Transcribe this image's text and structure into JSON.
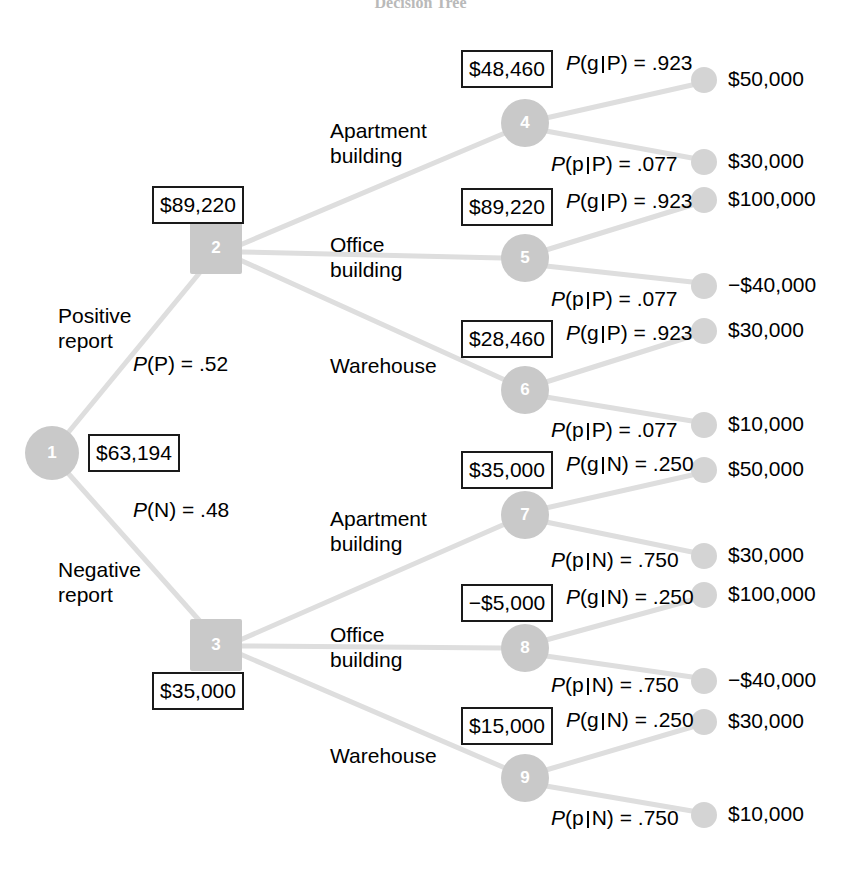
{
  "figure": {
    "title": "Decision Tree",
    "type": "decision-tree"
  },
  "nodes": [
    {
      "id": "1",
      "label": "1",
      "kind": "chance",
      "x": 52,
      "y": 453,
      "r": 27,
      "ev": "$63,194"
    },
    {
      "id": "2",
      "label": "2",
      "kind": "decision",
      "x": 216,
      "y": 248,
      "r": 26,
      "ev": "$89,220"
    },
    {
      "id": "3",
      "label": "3",
      "kind": "decision",
      "x": 216,
      "y": 645,
      "r": 26,
      "ev": "$35,000"
    },
    {
      "id": "4",
      "label": "4",
      "kind": "chance",
      "x": 525,
      "y": 123,
      "r": 24,
      "ev": "$48,460"
    },
    {
      "id": "5",
      "label": "5",
      "kind": "chance",
      "x": 525,
      "y": 258,
      "r": 24,
      "ev": "$89,220"
    },
    {
      "id": "6",
      "label": "6",
      "kind": "chance",
      "x": 525,
      "y": 390,
      "r": 24,
      "ev": "$28,460"
    },
    {
      "id": "7",
      "label": "7",
      "kind": "chance",
      "x": 525,
      "y": 515,
      "r": 24,
      "ev": "$35,000"
    },
    {
      "id": "8",
      "label": "8",
      "kind": "chance",
      "x": 525,
      "y": 648,
      "r": 24,
      "ev": "-$5,000"
    },
    {
      "id": "9",
      "label": "9",
      "kind": "chance",
      "x": 525,
      "y": 778,
      "r": 24,
      "ev": "$15,000"
    }
  ],
  "ev_boxes": [
    {
      "for": "4",
      "text": "$48,460",
      "x": 461,
      "y": 50,
      "w": 92,
      "h": 38
    },
    {
      "for": "2",
      "text": "$89,220",
      "x": 152,
      "y": 186,
      "w": 92,
      "h": 38
    },
    {
      "for": "5",
      "text": "$89,220",
      "x": 461,
      "y": 188,
      "w": 92,
      "h": 38
    },
    {
      "for": "6",
      "text": "$28,460",
      "x": 461,
      "y": 320,
      "w": 92,
      "h": 38
    },
    {
      "for": "1",
      "text": "$63,194",
      "x": 88,
      "y": 434,
      "w": 92,
      "h": 38
    },
    {
      "for": "7",
      "text": "$35,000",
      "x": 461,
      "y": 451,
      "w": 92,
      "h": 38
    },
    {
      "for": "8",
      "text": "-$5,000",
      "x": 461,
      "y": 584,
      "w": 92,
      "h": 38
    },
    {
      "for": "3",
      "text": "$35,000",
      "x": 152,
      "y": 672,
      "w": 92,
      "h": 38
    },
    {
      "for": "9",
      "text": "$15,000",
      "x": 461,
      "y": 707,
      "w": 92,
      "h": 38
    }
  ],
  "branch_labels": [
    {
      "id": "positive-report",
      "text": "Positive\nreport",
      "x": 58,
      "y": 303
    },
    {
      "id": "negative-report",
      "text": "Negative\nreport",
      "x": 58,
      "y": 557
    },
    {
      "id": "apartment-building-upper",
      "text": "Apartment\nbuilding",
      "x": 330,
      "y": 118
    },
    {
      "id": "office-building-upper",
      "text": "Office\nbuilding",
      "x": 330,
      "y": 232
    },
    {
      "id": "warehouse-upper",
      "text": "Warehouse",
      "x": 330,
      "y": 353
    },
    {
      "id": "apartment-building-lower",
      "text": "Apartment\nbuilding",
      "x": 330,
      "y": 506
    },
    {
      "id": "office-building-lower",
      "text": "Office\nbuilding",
      "x": 330,
      "y": 622
    },
    {
      "id": "warehouse-lower",
      "text": "Warehouse",
      "x": 330,
      "y": 743
    }
  ],
  "probability_labels": [
    {
      "id": "p-positive",
      "prefix": "P",
      "arg": "P",
      "cond": "",
      "value": ".52",
      "x": 133,
      "y": 352
    },
    {
      "id": "p-negative",
      "prefix": "P",
      "arg": "N",
      "cond": "",
      "value": ".48",
      "x": 133,
      "y": 498
    },
    {
      "id": "p-g-P-4",
      "prefix": "P",
      "arg": "g",
      "cond": "P",
      "value": ".923",
      "x": 566,
      "y": 51
    },
    {
      "id": "p-p-P-4",
      "prefix": "P",
      "arg": "p",
      "cond": "P",
      "value": ".077",
      "x": 551,
      "y": 152
    },
    {
      "id": "p-g-P-5",
      "prefix": "P",
      "arg": "g",
      "cond": "P",
      "value": ".923",
      "x": 566,
      "y": 189
    },
    {
      "id": "p-p-P-5",
      "prefix": "P",
      "arg": "p",
      "cond": "P",
      "value": ".077",
      "x": 551,
      "y": 287
    },
    {
      "id": "p-g-P-6",
      "prefix": "P",
      "arg": "g",
      "cond": "P",
      "value": ".923",
      "x": 566,
      "y": 321
    },
    {
      "id": "p-p-P-6",
      "prefix": "P",
      "arg": "p",
      "cond": "P",
      "value": ".077",
      "x": 551,
      "y": 418
    },
    {
      "id": "p-g-N-7",
      "prefix": "P",
      "arg": "g",
      "cond": "N",
      "value": ".250",
      "x": 566,
      "y": 452
    },
    {
      "id": "p-p-N-7",
      "prefix": "P",
      "arg": "p",
      "cond": "N",
      "value": ".750",
      "x": 551,
      "y": 548
    },
    {
      "id": "p-g-N-8",
      "prefix": "P",
      "arg": "g",
      "cond": "N",
      "value": ".250",
      "x": 566,
      "y": 585
    },
    {
      "id": "p-p-N-8",
      "prefix": "P",
      "arg": "p",
      "cond": "N",
      "value": ".750",
      "x": 551,
      "y": 673
    },
    {
      "id": "p-g-N-9",
      "prefix": "P",
      "arg": "g",
      "cond": "N",
      "value": ".250",
      "x": 566,
      "y": 708
    },
    {
      "id": "p-p-N-9",
      "prefix": "P",
      "arg": "p",
      "cond": "N",
      "value": ".750",
      "x": 551,
      "y": 806
    }
  ],
  "terminals": [
    {
      "id": "t1",
      "payoff": "$50,000",
      "cx": 704,
      "cy": 80,
      "r": 13,
      "from": "4"
    },
    {
      "id": "t2",
      "payoff": "$30,000",
      "cx": 704,
      "cy": 162,
      "r": 13,
      "from": "4"
    },
    {
      "id": "t3",
      "payoff": "$100,000",
      "cx": 704,
      "cy": 200,
      "r": 13,
      "from": "5"
    },
    {
      "id": "t4",
      "payoff": "-$40,000",
      "cx": 704,
      "cy": 286,
      "r": 13,
      "from": "5"
    },
    {
      "id": "t5",
      "payoff": "$30,000",
      "cx": 704,
      "cy": 331,
      "r": 13,
      "from": "6"
    },
    {
      "id": "t6",
      "payoff": "$10,000",
      "cx": 704,
      "cy": 425,
      "r": 13,
      "from": "6"
    },
    {
      "id": "t7",
      "payoff": "$50,000",
      "cx": 704,
      "cy": 470,
      "r": 13,
      "from": "7"
    },
    {
      "id": "t8",
      "payoff": "$30,000",
      "cx": 704,
      "cy": 556,
      "r": 13,
      "from": "7"
    },
    {
      "id": "t9",
      "payoff": "$100,000",
      "cx": 704,
      "cy": 595,
      "r": 13,
      "from": "8"
    },
    {
      "id": "t10",
      "payoff": "-$40,000",
      "cx": 704,
      "cy": 681,
      "r": 13,
      "from": "8"
    },
    {
      "id": "t11",
      "payoff": "$30,000",
      "cx": 704,
      "cy": 722,
      "r": 13,
      "from": "9"
    },
    {
      "id": "t12",
      "payoff": "$10,000",
      "cx": 704,
      "cy": 815,
      "r": 13,
      "from": "9"
    }
  ],
  "edges": [
    {
      "from": "1",
      "to": "2",
      "x1": 67,
      "y1": 434,
      "x2": 206,
      "y2": 265
    },
    {
      "from": "1",
      "to": "3",
      "x1": 67,
      "y1": 472,
      "x2": 206,
      "y2": 628
    },
    {
      "from": "2",
      "to": "4",
      "x1": 240,
      "y1": 245,
      "x2": 505,
      "y2": 133
    },
    {
      "from": "2",
      "to": "5",
      "x1": 242,
      "y1": 252,
      "x2": 502,
      "y2": 258
    },
    {
      "from": "2",
      "to": "6",
      "x1": 240,
      "y1": 260,
      "x2": 505,
      "y2": 380
    },
    {
      "from": "3",
      "to": "7",
      "x1": 240,
      "y1": 640,
      "x2": 505,
      "y2": 524
    },
    {
      "from": "3",
      "to": "8",
      "x1": 242,
      "y1": 646,
      "x2": 502,
      "y2": 648
    },
    {
      "from": "3",
      "to": "9",
      "x1": 240,
      "y1": 654,
      "x2": 505,
      "y2": 768
    },
    {
      "from": "4",
      "to": "t1",
      "x1": 546,
      "y1": 118,
      "x2": 692,
      "y2": 85
    },
    {
      "from": "4",
      "to": "t2",
      "x1": 546,
      "y1": 131,
      "x2": 692,
      "y2": 158
    },
    {
      "from": "5",
      "to": "t3",
      "x1": 546,
      "y1": 250,
      "x2": 692,
      "y2": 205
    },
    {
      "from": "5",
      "to": "t4",
      "x1": 546,
      "y1": 266,
      "x2": 692,
      "y2": 282
    },
    {
      "from": "6",
      "to": "t5",
      "x1": 546,
      "y1": 382,
      "x2": 692,
      "y2": 336
    },
    {
      "from": "6",
      "to": "t6",
      "x1": 546,
      "y1": 397,
      "x2": 692,
      "y2": 421
    },
    {
      "from": "7",
      "to": "t7",
      "x1": 546,
      "y1": 508,
      "x2": 692,
      "y2": 475
    },
    {
      "from": "7",
      "to": "t8",
      "x1": 546,
      "y1": 522,
      "x2": 692,
      "y2": 552
    },
    {
      "from": "8",
      "to": "t9",
      "x1": 546,
      "y1": 640,
      "x2": 692,
      "y2": 600
    },
    {
      "from": "8",
      "to": "t10",
      "x1": 546,
      "y1": 656,
      "x2": 692,
      "y2": 677
    },
    {
      "from": "9",
      "to": "t11",
      "x1": 546,
      "y1": 770,
      "x2": 692,
      "y2": 727
    },
    {
      "from": "9",
      "to": "t12",
      "x1": 546,
      "y1": 786,
      "x2": 692,
      "y2": 811
    }
  ],
  "colors": {
    "node_fill": "#c9c9c9",
    "terminal_fill": "#d4d4d4",
    "edge": "#dedede",
    "box_border": "#1a1a1a",
    "text": "#000000"
  }
}
